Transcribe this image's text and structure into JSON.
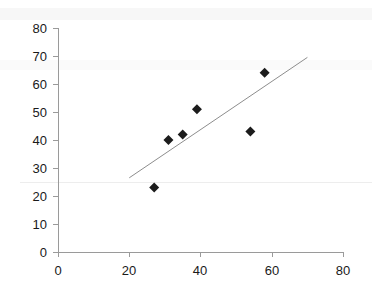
{
  "chart_data": {
    "type": "scatter",
    "title": "",
    "subtitle": "",
    "xlabel": "",
    "ylabel": "",
    "xlim": [
      0,
      80
    ],
    "ylim": [
      0,
      80
    ],
    "xticks": [
      "0",
      "20",
      "40",
      "60",
      "80"
    ],
    "xtick_values": [
      0,
      20,
      40,
      60,
      80
    ],
    "yticks": [
      "0",
      "10",
      "20",
      "30",
      "40",
      "50",
      "60",
      "70",
      "80"
    ],
    "ytick_values": [
      0,
      10,
      20,
      30,
      40,
      50,
      60,
      70,
      80
    ],
    "grid": false,
    "legend": null,
    "legend_position": "none",
    "marker": "diamond",
    "marker_color": "#1c1c1c",
    "series": [
      {
        "name": "data",
        "points": [
          {
            "x": 27,
            "y": 23
          },
          {
            "x": 31,
            "y": 40
          },
          {
            "x": 35,
            "y": 42
          },
          {
            "x": 39,
            "y": 51
          },
          {
            "x": 54,
            "y": 43
          },
          {
            "x": 58,
            "y": 64
          }
        ]
      }
    ],
    "trendline": {
      "name": "linear-fit",
      "color": "#8d8d8d",
      "x_start": 20,
      "y_start": 26.5,
      "x_end": 70,
      "y_end": 69.5
    }
  },
  "axes": {
    "x_axis_name": "x-axis",
    "y_axis_name": "y-axis"
  }
}
